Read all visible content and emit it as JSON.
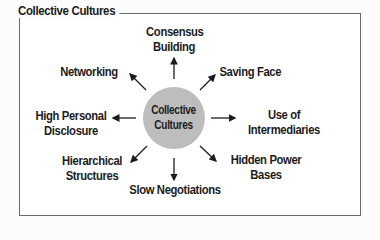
{
  "diagram": {
    "title": "Collective Cultures",
    "center": {
      "line1": "Collective",
      "line2": "Cultures",
      "color": "#bdbdbd"
    },
    "nodes": {
      "top": {
        "line1": "Consensus",
        "line2": "Building"
      },
      "top_right": {
        "line1": "Saving Face"
      },
      "right": {
        "line1": "Use of",
        "line2": "Intermediaries"
      },
      "bottom_right": {
        "line1": "Hidden Power",
        "line2": "Bases"
      },
      "bottom": {
        "line1": "Slow Negotiations"
      },
      "bottom_left": {
        "line1": "Hierarchical",
        "line2": "Structures"
      },
      "left": {
        "line1": "High Personal",
        "line2": "Disclosure"
      },
      "top_left": {
        "line1": "Networking"
      }
    }
  }
}
